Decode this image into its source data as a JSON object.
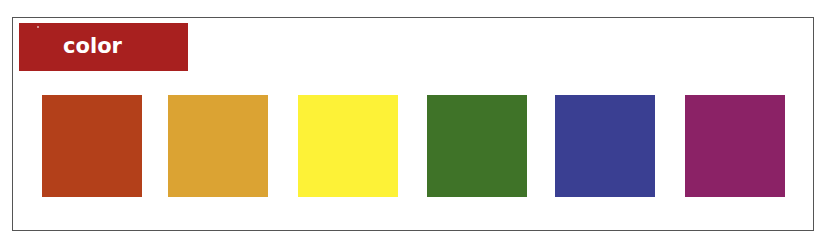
{
  "header": {
    "title": "color",
    "background": "#a8201f"
  },
  "swatches": [
    {
      "name": "red-orange",
      "color": "#b3401a"
    },
    {
      "name": "gold",
      "color": "#dba333"
    },
    {
      "name": "yellow",
      "color": "#fdf237"
    },
    {
      "name": "green",
      "color": "#3f7328"
    },
    {
      "name": "blue",
      "color": "#3a3f92"
    },
    {
      "name": "purple",
      "color": "#8b2266"
    }
  ]
}
